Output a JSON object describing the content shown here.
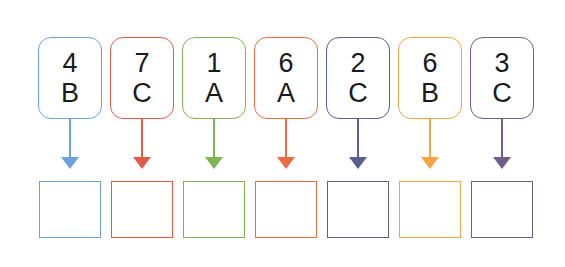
{
  "columns": [
    {
      "number": "4",
      "letter": "B",
      "color": "#6aa2e0",
      "answer": ""
    },
    {
      "number": "7",
      "letter": "C",
      "color": "#e45a48",
      "answer": ""
    },
    {
      "number": "1",
      "letter": "A",
      "color": "#7fb452",
      "answer": ""
    },
    {
      "number": "6",
      "letter": "A",
      "color": "#ee6a45",
      "answer": ""
    },
    {
      "number": "2",
      "letter": "C",
      "color": "#5c5e8c",
      "answer": ""
    },
    {
      "number": "6",
      "letter": "B",
      "color": "#f5a445",
      "answer": ""
    },
    {
      "number": "3",
      "letter": "C",
      "color": "#6f5e8a",
      "answer": ""
    }
  ]
}
